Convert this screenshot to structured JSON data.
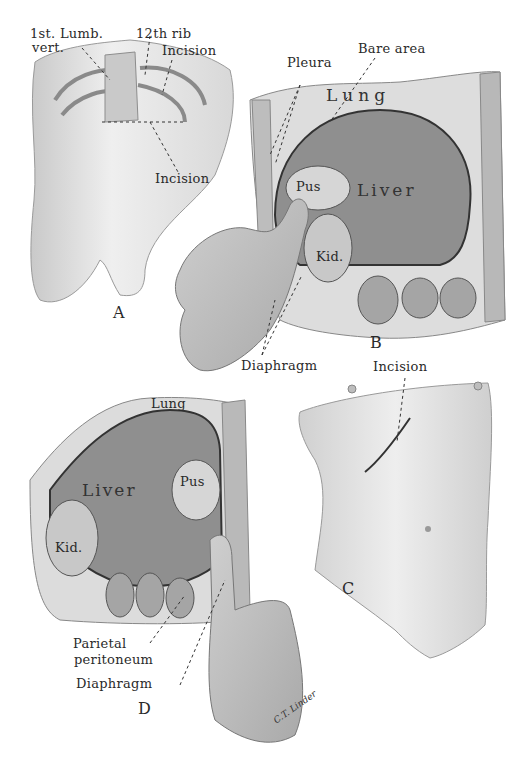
{
  "figure": {
    "palette": {
      "paper": "#ffffff",
      "skin": "#e6e6e6",
      "liver": "#8f8f8f",
      "lung": "#dcdcdc",
      "pus": "#d4d4d4",
      "ink": "#2a2a2a"
    },
    "signature": "C.T. Linder",
    "panels": [
      {
        "id": "A",
        "letter": "A",
        "labels": {
          "lumbar": "1st. Lumb.",
          "vert": "vert.",
          "rib": "12th rib",
          "incision_top": "Incision",
          "incision_bottom": "Incision"
        }
      },
      {
        "id": "B",
        "letter": "B",
        "labels": {
          "pleura": "Pleura",
          "bare_area": "Bare area",
          "lung": "Lung",
          "pus": "Pus",
          "liver": "Liver",
          "kid": "Kid.",
          "diaphragm": "Diaphragm"
        }
      },
      {
        "id": "C",
        "letter": "C",
        "labels": {
          "incision": "Incision"
        }
      },
      {
        "id": "D",
        "letter": "D",
        "labels": {
          "lung": "Lung",
          "liver": "Liver",
          "pus": "Pus",
          "kid": "Kid.",
          "parietal": "Parietal",
          "peritoneum": "peritoneum",
          "diaphragm": "Diaphragm"
        }
      }
    ]
  }
}
